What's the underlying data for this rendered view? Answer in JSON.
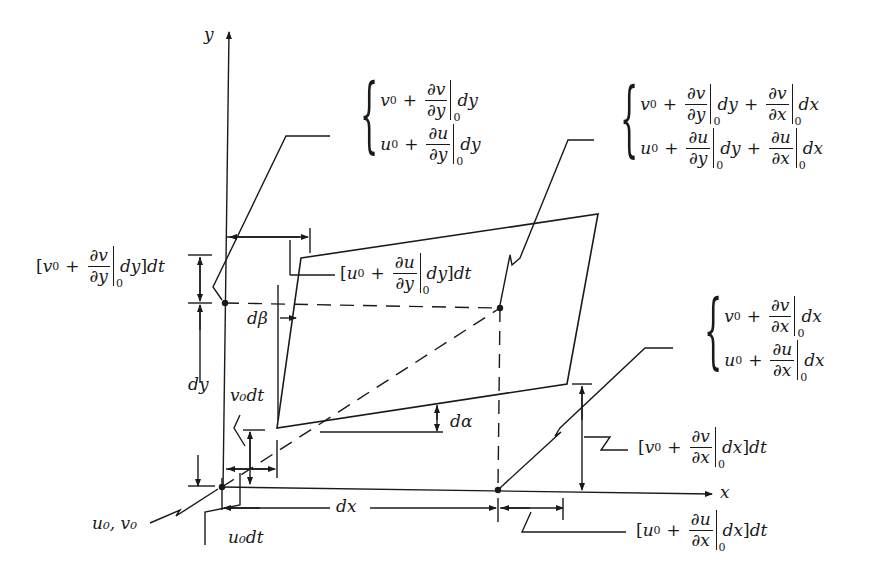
{
  "diagram": {
    "axes": {
      "x_label": "x",
      "y_label": "y"
    },
    "labels": {
      "origin": "u₀, v₀",
      "u0dt": "u₀dt",
      "v0dt": "v₀dt",
      "dx": "dx",
      "dy": "dy",
      "dalpha": "dα",
      "dbeta": "dβ"
    },
    "expressions": {
      "top_left_corner": {
        "v_line": "v₀ + ∂v/∂y|₀ dy",
        "u_line": "u₀ + ∂u/∂y|₀ dy"
      },
      "top_right_corner": {
        "v_line": "v₀ + ∂v/∂y|₀ dy + ∂v/∂x|₀ dx",
        "u_line": "u₀ + ∂u/∂y|₀ dy + ∂u/∂x|₀ dx"
      },
      "bottom_right_corner": {
        "v_line": "v₀ + ∂v/∂x|₀ dx",
        "u_line": "u₀ + ∂u/∂x|₀ dx"
      },
      "top_left_vertical_disp": "[v₀ + ∂v/∂y|₀ dy]dt",
      "top_left_horizontal_disp": "[u₀ + ∂u/∂y|₀ dy]dt",
      "bottom_right_vertical_disp": "[v₀ + ∂v/∂x|₀ dx]dt",
      "bottom_right_horizontal_disp": "[u₀ + ∂u/∂x|₀ dx]dt"
    },
    "text_parts": {
      "v0": "v",
      "u0": "u",
      "sub0": "0",
      "plus": "+",
      "dv": "∂v",
      "du": "∂u",
      "dy_den": "∂y",
      "dx_den": "∂x",
      "dy": "dy",
      "dx": "dx",
      "dt": "dt",
      "lbr": "[",
      "rbr": "]",
      "brace": "{",
      "comma": ","
    },
    "colors": {
      "ink": "#1a1a1a",
      "background": "#ffffff"
    }
  }
}
